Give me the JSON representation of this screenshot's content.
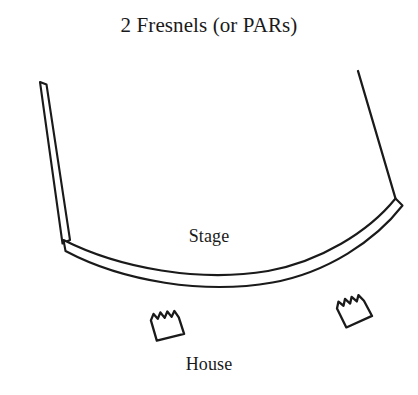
{
  "diagram": {
    "kind": "stage-lighting-plot",
    "title": "2 Fresnels (or PARs)",
    "labels": {
      "stage": "Stage",
      "house": "House"
    },
    "colors": {
      "background": "#ffffff",
      "line": "#1a1a1a",
      "fill": "#ffffff"
    },
    "geometry": {
      "left_wall": {
        "name": "left-proscenium-wall",
        "outer": "M 40,82 L 62,243 L 70,240 L 46,84 Z",
        "apex": [
          40,
          82
        ],
        "base": [
          62,
          243
        ]
      },
      "right_wall": {
        "name": "right-proscenium-wall",
        "path": "M 358,72 L 395,199",
        "top": [
          358,
          72
        ],
        "base": [
          395,
          199
        ]
      },
      "stage_apron": {
        "name": "curved-stage-apron-band",
        "upper_curve": "M 64,240 C 120,268 200,282 268,271 C 320,262 368,232 395,199",
        "lower_curve": "M 66,250 C 124,281 204,294 272,282 C 326,272 376,240 402,205",
        "right_cap": "M 395,199 L 402,205",
        "left_cap": "M 64,240 L 66,250"
      },
      "fixtures": [
        {
          "name": "fresnel-fixture-left",
          "type": "fresnel-or-par",
          "center": [
            168,
            327
          ],
          "rotation_deg": -8,
          "teeth": 4
        },
        {
          "name": "fresnel-fixture-right",
          "type": "fresnel-or-par",
          "center": [
            355,
            312
          ],
          "rotation_deg": -18,
          "teeth": 4
        }
      ]
    }
  }
}
